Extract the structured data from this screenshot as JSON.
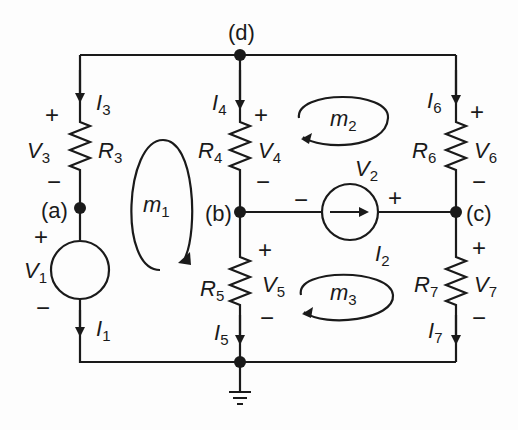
{
  "diagram": {
    "type": "circuit",
    "nodes": [
      {
        "id": "a",
        "label": "(a)"
      },
      {
        "id": "b",
        "label": "(b)"
      },
      {
        "id": "c",
        "label": "(c)"
      },
      {
        "id": "d",
        "label": "(d)"
      },
      {
        "id": "ground",
        "label": ""
      }
    ],
    "components": [
      {
        "id": "R3",
        "name": "R",
        "sub": "3",
        "voltage": {
          "name": "V",
          "sub": "3"
        },
        "current": {
          "name": "I",
          "sub": "3"
        }
      },
      {
        "id": "R4",
        "name": "R",
        "sub": "4",
        "voltage": {
          "name": "V",
          "sub": "4"
        },
        "current": {
          "name": "I",
          "sub": "4"
        }
      },
      {
        "id": "R5",
        "name": "R",
        "sub": "5",
        "voltage": {
          "name": "V",
          "sub": "5"
        },
        "current": {
          "name": "I",
          "sub": "5"
        }
      },
      {
        "id": "R6",
        "name": "R",
        "sub": "6",
        "voltage": {
          "name": "V",
          "sub": "6"
        },
        "current": {
          "name": "I",
          "sub": "6"
        }
      },
      {
        "id": "R7",
        "name": "R",
        "sub": "7",
        "voltage": {
          "name": "V",
          "sub": "7"
        },
        "current": {
          "name": "I",
          "sub": "7"
        }
      },
      {
        "id": "V1",
        "name": "V",
        "sub": "1",
        "current": {
          "name": "I",
          "sub": "1"
        }
      },
      {
        "id": "I2",
        "name": "I",
        "sub": "2",
        "voltage": {
          "name": "V",
          "sub": "2"
        }
      }
    ],
    "meshes": [
      {
        "name": "m",
        "sub": "1"
      },
      {
        "name": "m",
        "sub": "2"
      },
      {
        "name": "m",
        "sub": "3"
      }
    ],
    "signs": {
      "plus": "+",
      "minus": "−"
    }
  }
}
